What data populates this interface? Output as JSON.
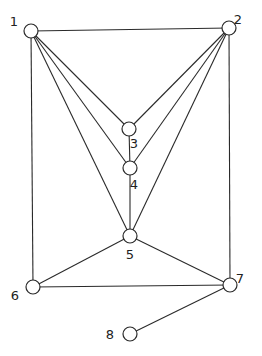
{
  "graph": {
    "type": "undirected",
    "nodes": [
      {
        "id": "1",
        "label": "1",
        "x": 31,
        "y": 31,
        "lx": 14,
        "ly": 26
      },
      {
        "id": "2",
        "label": "2",
        "x": 229,
        "y": 28,
        "lx": 238,
        "ly": 24
      },
      {
        "id": "3",
        "label": "3",
        "x": 129,
        "y": 129,
        "lx": 134,
        "ly": 148
      },
      {
        "id": "4",
        "label": "4",
        "x": 130,
        "y": 168,
        "lx": 134,
        "ly": 189
      },
      {
        "id": "5",
        "label": "5",
        "x": 130,
        "y": 236,
        "lx": 130,
        "ly": 259
      },
      {
        "id": "6",
        "label": "6",
        "x": 33,
        "y": 287,
        "lx": 15,
        "ly": 300
      },
      {
        "id": "7",
        "label": "7",
        "x": 230,
        "y": 285,
        "lx": 240,
        "ly": 283
      },
      {
        "id": "8",
        "label": "8",
        "x": 130,
        "y": 334,
        "lx": 110,
        "ly": 339
      }
    ],
    "edges": [
      [
        "1",
        "2"
      ],
      [
        "1",
        "3"
      ],
      [
        "1",
        "4"
      ],
      [
        "1",
        "5"
      ],
      [
        "1",
        "6"
      ],
      [
        "2",
        "3"
      ],
      [
        "2",
        "4"
      ],
      [
        "2",
        "5"
      ],
      [
        "2",
        "7"
      ],
      [
        "3",
        "4"
      ],
      [
        "4",
        "5"
      ],
      [
        "5",
        "6"
      ],
      [
        "5",
        "7"
      ],
      [
        "6",
        "7"
      ],
      [
        "7",
        "8"
      ]
    ],
    "node_radius": 7,
    "colors": {
      "stroke": "#2a2a2a",
      "fill": "#ffffff",
      "background": "#ffffff"
    }
  }
}
